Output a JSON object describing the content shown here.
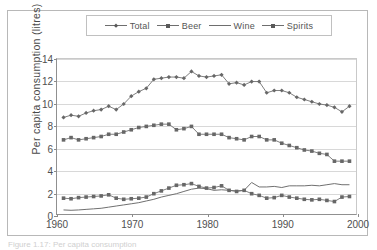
{
  "figure": {
    "caption_fragment": "Figure 1.17: Per capita consumption"
  },
  "legend": {
    "position": "top-center",
    "entries": [
      {
        "label": "Total",
        "marker": "diamond-marker-icon",
        "color": "#6e6e6e"
      },
      {
        "label": "Beer",
        "marker": "square-marker-icon",
        "color": "#6e6e6e"
      },
      {
        "label": "Wine",
        "marker": "line-only-marker-icon",
        "color": "#6e6e6e"
      },
      {
        "label": "Spirits",
        "marker": "square-marker-icon",
        "color": "#6e6e6e"
      }
    ]
  },
  "axes": {
    "ylabel": "Per capita consumption (litres)",
    "xlabel": "",
    "yticks": [
      0,
      2,
      4,
      6,
      8,
      10,
      12,
      14
    ],
    "xticks": [
      1960,
      1970,
      1980,
      1990,
      2000
    ],
    "ylim": [
      0,
      14
    ],
    "xlim": [
      1960,
      2000
    ],
    "grid": "horizontal"
  },
  "chart_data": {
    "type": "line",
    "title": "",
    "xlabel": "",
    "ylabel": "Per capita consumption (litres)",
    "xlim": [
      1960,
      2000
    ],
    "ylim": [
      0,
      14
    ],
    "grid": true,
    "legend_position": "top-center",
    "x": [
      1961,
      1962,
      1963,
      1964,
      1965,
      1966,
      1967,
      1968,
      1969,
      1970,
      1971,
      1972,
      1973,
      1974,
      1975,
      1976,
      1977,
      1978,
      1979,
      1980,
      1981,
      1982,
      1983,
      1984,
      1985,
      1986,
      1987,
      1988,
      1989,
      1990,
      1991,
      1992,
      1993,
      1994,
      1995,
      1996,
      1997,
      1998,
      1999
    ],
    "series": [
      {
        "name": "Total",
        "marker": "diamond",
        "values": [
          8.7,
          8.9,
          8.8,
          9.1,
          9.3,
          9.4,
          9.7,
          9.4,
          9.9,
          10.6,
          11.0,
          11.3,
          12.1,
          12.2,
          12.3,
          12.3,
          12.2,
          12.8,
          12.4,
          12.3,
          12.4,
          12.5,
          11.7,
          11.8,
          11.6,
          11.9,
          11.9,
          10.9,
          11.1,
          11.1,
          10.9,
          10.5,
          10.3,
          10.1,
          9.9,
          9.8,
          9.6,
          9.2,
          9.7
        ]
      },
      {
        "name": "Beer",
        "marker": "square",
        "values": [
          6.7,
          6.9,
          6.7,
          6.8,
          6.9,
          7.0,
          7.2,
          7.2,
          7.4,
          7.6,
          7.8,
          7.9,
          8.0,
          8.1,
          8.1,
          7.6,
          7.7,
          7.9,
          7.2,
          7.2,
          7.2,
          7.2,
          6.9,
          6.8,
          6.7,
          7.0,
          7.0,
          6.7,
          6.7,
          6.4,
          6.2,
          6.0,
          5.8,
          5.7,
          5.5,
          5.4,
          4.8,
          4.8,
          4.8
        ]
      },
      {
        "name": "Wine",
        "marker": "none",
        "values": [
          0.45,
          0.42,
          0.45,
          0.5,
          0.55,
          0.6,
          0.7,
          0.8,
          0.9,
          1.0,
          1.1,
          1.25,
          1.4,
          1.6,
          1.75,
          1.9,
          2.1,
          2.3,
          2.4,
          2.35,
          2.2,
          2.25,
          2.2,
          2.15,
          2.2,
          2.9,
          2.5,
          2.5,
          2.55,
          2.45,
          2.6,
          2.6,
          2.6,
          2.65,
          2.6,
          2.7,
          2.8,
          2.7,
          2.7
        ]
      },
      {
        "name": "Spirits",
        "marker": "square",
        "values": [
          1.5,
          1.45,
          1.55,
          1.6,
          1.65,
          1.7,
          1.8,
          1.5,
          1.4,
          1.45,
          1.5,
          1.6,
          1.9,
          2.15,
          2.4,
          2.65,
          2.7,
          2.8,
          2.55,
          2.4,
          2.45,
          2.6,
          2.2,
          2.1,
          2.2,
          1.9,
          1.75,
          1.5,
          1.55,
          1.75,
          1.6,
          1.5,
          1.4,
          1.35,
          1.4,
          1.3,
          1.2,
          1.6,
          1.65
        ]
      }
    ]
  }
}
